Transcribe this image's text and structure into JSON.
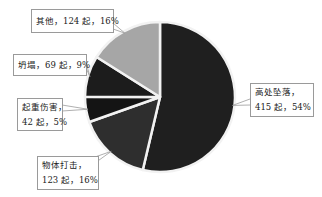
{
  "chart_data": {
    "type": "pie",
    "title": "",
    "start_angle_deg": 0,
    "direction": "clockwise",
    "unit": "起",
    "slices": [
      {
        "name": "高处坠落",
        "count": 415,
        "percent": 54,
        "color": "#1f1f1f",
        "label_line1": "高处坠落，",
        "label_line2": "415 起，54%"
      },
      {
        "name": "物体打击",
        "count": 123,
        "percent": 16,
        "color": "#2e2e2e",
        "label_line1": "物体打击，",
        "label_line2": "123 起，16%"
      },
      {
        "name": "起重伤害",
        "count": 42,
        "percent": 5,
        "color": "#141414",
        "label_line1": "起重伤害，",
        "label_line2": "42 起，5%"
      },
      {
        "name": "坍塌",
        "count": 69,
        "percent": 9,
        "color": "#1c1c1c",
        "label_line1": "坍塌，69 起，9%",
        "label_line2": ""
      },
      {
        "name": "其他",
        "count": 124,
        "percent": 16,
        "color": "#a6a6a6",
        "label_line1": "其他，124 起，16%",
        "label_line2": ""
      }
    ],
    "legend": "none"
  }
}
